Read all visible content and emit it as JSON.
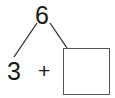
{
  "number_bond": {
    "whole": "6",
    "part_left": "3",
    "operator": "+",
    "part_right": ""
  },
  "colors": {
    "stroke": "#1a1a1a",
    "box_border": "#555555",
    "background": "#ffffff"
  }
}
